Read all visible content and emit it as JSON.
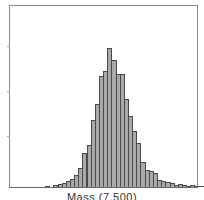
{
  "chart_data": {
    "type": "bar",
    "title": "",
    "xlabel": "Mass (7,500)",
    "ylabel": "",
    "grid": false,
    "legend": null,
    "bar_color": "#a9a9a9",
    "edge_color": "#4a4a4a",
    "bin_start_px": 35,
    "bin_width_px": 4.15,
    "ymax": 140,
    "values": [
      0.5,
      0,
      2,
      3,
      4,
      6,
      8,
      12,
      19,
      34,
      42,
      68,
      84,
      112,
      117,
      140,
      128,
      114,
      114,
      89,
      72,
      56,
      44,
      25,
      17,
      16,
      14,
      7,
      6,
      5,
      4,
      2,
      3,
      2,
      1,
      2,
      1.5,
      1
    ]
  }
}
